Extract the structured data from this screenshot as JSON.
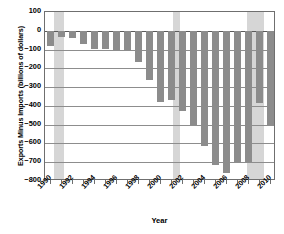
{
  "chart_data": {
    "type": "bar",
    "title": "",
    "xlabel": "Year",
    "ylabel": "Exports Minus Imports (billions of dollars)",
    "ylim": [
      -800,
      100
    ],
    "xlim": [
      1989.5,
      2010.5
    ],
    "grid": true,
    "legend": null,
    "y_ticks": [
      100,
      0,
      -100,
      -200,
      -300,
      -400,
      -500,
      -600,
      -700,
      -800
    ],
    "y_tick_labels": [
      "100",
      "0",
      "−100",
      "−200",
      "−300",
      "−400",
      "−500",
      "−600",
      "−700",
      "−800"
    ],
    "x_tick_labels": [
      "1990",
      "1992",
      "1994",
      "1996",
      "1998",
      "2000",
      "2002",
      "2004",
      "2006",
      "2008",
      "2010"
    ],
    "x_tick_values": [
      1990,
      1992,
      1994,
      1996,
      1998,
      2000,
      2002,
      2004,
      2006,
      2008,
      2010
    ],
    "categories": [
      1990,
      1991,
      1992,
      1993,
      1994,
      1995,
      1996,
      1997,
      1998,
      1999,
      2000,
      2001,
      2002,
      2003,
      2004,
      2005,
      2006,
      2007,
      2008,
      2009,
      2010
    ],
    "values": [
      -80,
      -31,
      -39,
      -70,
      -98,
      -96,
      -104,
      -108,
      -166,
      -263,
      -380,
      -370,
      -425,
      -500,
      -615,
      -715,
      -760,
      -700,
      -700,
      -385,
      -500
    ],
    "series": [
      {
        "name": "Exports minus imports",
        "color": "#8c8c8c",
        "values": [
          -80,
          -31,
          -39,
          -70,
          -98,
          -96,
          -104,
          -108,
          -166,
          -263,
          -380,
          -370,
          -425,
          -500,
          -615,
          -715,
          -760,
          -700,
          -700,
          -385,
          -500
        ]
      }
    ],
    "shaded_regions": [
      {
        "label": "recession",
        "start": 1990.3,
        "end": 1991.2,
        "color": "#d6d6d6"
      },
      {
        "label": "recession",
        "start": 2001.1,
        "end": 2001.8,
        "color": "#d6d6d6"
      },
      {
        "label": "recession",
        "start": 2007.9,
        "end": 2009.4,
        "color": "#d6d6d6"
      }
    ]
  },
  "axis": {
    "y_title": "Exports Minus Imports (billions of dollars)",
    "x_title": "Year"
  }
}
